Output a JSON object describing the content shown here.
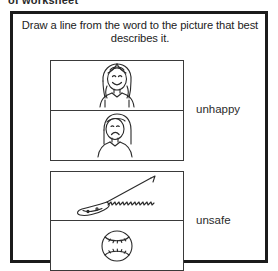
{
  "page": {
    "cut_off_header": "of worksheet",
    "background_color": "#ffffff",
    "ink_color": "#1b1b1b"
  },
  "worksheet": {
    "instruction": "Draw a line from the word to the picture that best describes it.",
    "picture_groups": [
      {
        "group_id": "group-1",
        "pictures": [
          {
            "name": "happy-girl",
            "description": "Smiling girl with long hair",
            "order": 1
          },
          {
            "name": "sad-girl",
            "description": "Frowning girl with long hair",
            "order": 2
          }
        ]
      },
      {
        "group_id": "group-2",
        "pictures": [
          {
            "name": "saw",
            "description": "Hand saw with serrated blade",
            "order": 1
          },
          {
            "name": "baseball",
            "description": "Baseball with stitching",
            "order": 2
          }
        ]
      }
    ],
    "words": [
      {
        "label": "unhappy",
        "matches_group": "group-1"
      },
      {
        "label": "unsafe",
        "matches_group": "group-2"
      }
    ]
  }
}
